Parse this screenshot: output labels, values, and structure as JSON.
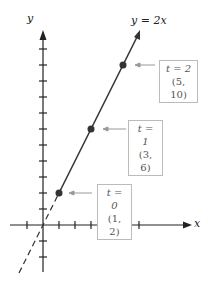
{
  "axes": {
    "x_label": "x",
    "y_label": "y"
  },
  "line": {
    "label": "y = 2x",
    "color": "#333333"
  },
  "points": [
    {
      "t_label": "t = 0",
      "coord_label": "(1, 2)",
      "x": 1,
      "y": 2
    },
    {
      "t_label": "t = 1",
      "coord_label": "(3, 6)",
      "x": 3,
      "y": 6
    },
    {
      "t_label": "t = 2",
      "coord_label": "(5, 10)",
      "x": 5,
      "y": 10
    }
  ],
  "colors": {
    "axis": "#222222",
    "point": "#333333",
    "arrow": "#999999",
    "box_border": "#bbbbbb"
  }
}
